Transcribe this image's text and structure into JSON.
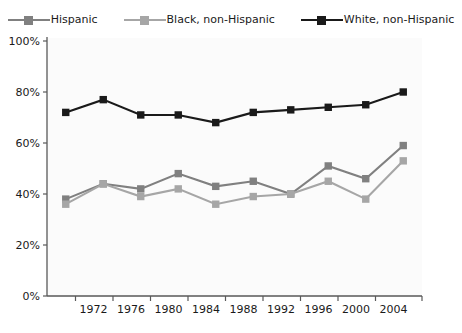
{
  "legend": {
    "position": "top-center",
    "entries": [
      {
        "label": "Hispanic",
        "color": "#808080",
        "marker": "square"
      },
      {
        "label": "Black, non-Hispanic",
        "color": "#a6a6a6",
        "marker": "square"
      },
      {
        "label": "White, non-Hispanic",
        "color": "#1a1a1a",
        "marker": "square"
      }
    ]
  },
  "axes": {
    "y_tick_labels": [
      "100%",
      "80%",
      "60%",
      "40%",
      "20%",
      "0%"
    ],
    "x_tick_labels": [
      "1972",
      "1976",
      "1980",
      "1984",
      "1988",
      "1992",
      "1996",
      "2000",
      "2004"
    ]
  },
  "chart_data": {
    "type": "line",
    "title": "",
    "subtitle": "",
    "xlabel": "",
    "ylabel": "",
    "x": [
      1970,
      1974,
      1978,
      1982,
      1986,
      1990,
      1994,
      1998,
      2002,
      2006
    ],
    "xlim": [
      1968,
      2008
    ],
    "ylim": [
      0,
      100
    ],
    "y_ticks": [
      0,
      20,
      40,
      60,
      80,
      100
    ],
    "x_ticks": [
      1972,
      1976,
      1980,
      1984,
      1988,
      1992,
      1996,
      2000,
      2004
    ],
    "grid": false,
    "legend_position": "top-center",
    "units": "percent",
    "series": [
      {
        "name": "Hispanic",
        "color": "#808080",
        "values": [
          38,
          44,
          42,
          48,
          43,
          45,
          40,
          51,
          46,
          59
        ]
      },
      {
        "name": "Black, non-Hispanic",
        "color": "#a6a6a6",
        "values": [
          36,
          44,
          39,
          42,
          36,
          39,
          40,
          45,
          38,
          53
        ]
      },
      {
        "name": "White, non-Hispanic",
        "color": "#1a1a1a",
        "values": [
          72,
          77,
          71,
          71,
          68,
          72,
          73,
          74,
          75,
          80
        ]
      }
    ]
  }
}
